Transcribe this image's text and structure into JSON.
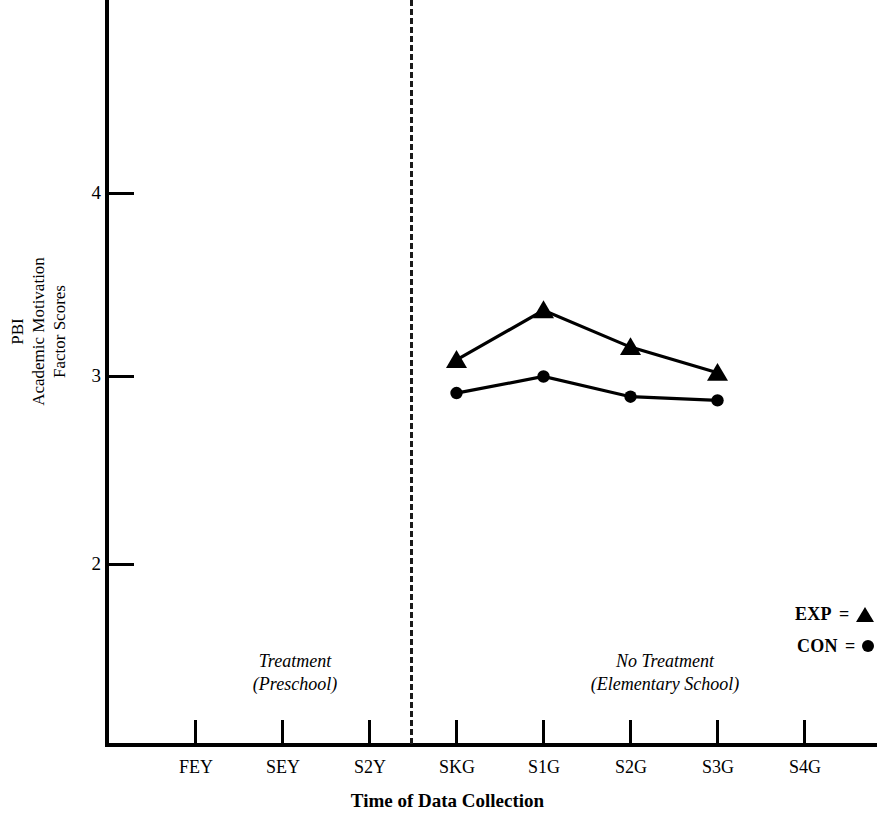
{
  "chart_data": {
    "type": "line",
    "title": "",
    "xlabel": "Time of Data Collection",
    "ylabel": "PBI Academic Motivation Factor Scores",
    "ylabel_lines": [
      "PBI",
      "Academic Motivation",
      "Factor Scores"
    ],
    "categories": [
      "FEY",
      "SEY",
      "S2Y",
      "SKG",
      "S1G",
      "S2G",
      "S3G",
      "S4G"
    ],
    "yticks": [
      2,
      3,
      4
    ],
    "ytick_labels": [
      "2",
      "3",
      "4"
    ],
    "ylim": [
      1.3,
      4.75
    ],
    "grid": false,
    "legend_position": "right-bottom",
    "series": [
      {
        "name": "EXP",
        "marker": "triangle",
        "color": "#000000",
        "x": [
          "SKG",
          "S1G",
          "S2G",
          "S3G"
        ],
        "values": [
          3.09,
          3.36,
          3.16,
          3.02
        ]
      },
      {
        "name": "CON",
        "marker": "circle",
        "color": "#000000",
        "x": [
          "SKG",
          "S1G",
          "S2G",
          "S3G"
        ],
        "values": [
          2.91,
          3.0,
          2.89,
          2.87
        ]
      }
    ],
    "annotations": [
      {
        "name": "treatment-phase",
        "lines": [
          "Treatment",
          "(Preschool)"
        ],
        "region": "FEY-S2Y"
      },
      {
        "name": "no-treatment-phase",
        "lines": [
          "No Treatment",
          "(Elementary School)"
        ],
        "region": "SKG-S4G"
      }
    ],
    "divider": {
      "label": "phase-divider",
      "after_category": "S2Y",
      "style": "dashed"
    }
  },
  "axes": {
    "y_tick_labels": [
      "4",
      "3",
      "2"
    ],
    "x_tick_labels": [
      "FEY",
      "SEY",
      "S2Y",
      "SKG",
      "S1G",
      "S2G",
      "S3G",
      "S4G"
    ],
    "y_title_lines": [
      "PBI",
      "Academic Motivation",
      "Factor Scores"
    ],
    "x_title": "Time of Data Collection"
  },
  "annotations": {
    "left": {
      "line1": "Treatment",
      "line2": "(Preschool)"
    },
    "right": {
      "line1": "No Treatment",
      "line2": "(Elementary School)"
    }
  },
  "legend": {
    "items": [
      {
        "label": "EXP",
        "equals": "=",
        "marker": "triangle"
      },
      {
        "label": "CON",
        "equals": "=",
        "marker": "circle"
      }
    ]
  }
}
